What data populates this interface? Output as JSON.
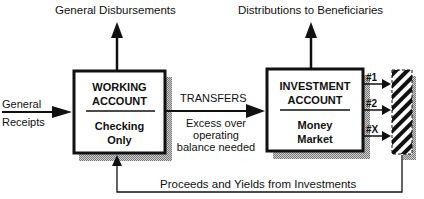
{
  "diagram": {
    "top_labels": {
      "general_disbursements": "General Disbursements",
      "distributions": "Distributions to Beneficiaries"
    },
    "input_label": {
      "line1": "General",
      "line2": "Receipts"
    },
    "working_account": {
      "title1": "WORKING",
      "title2": "ACCOUNT",
      "sub1": "Checking",
      "sub2": "Only"
    },
    "transfers": {
      "title": "TRANSFERS",
      "line1": "Excess over",
      "line2": "operating",
      "line3": "balance needed"
    },
    "investment_account": {
      "title1": "INVESTMENT",
      "title2": "ACCOUNT",
      "sub1": "Money",
      "sub2": "Market"
    },
    "investment_outputs": [
      "#1",
      "#2",
      "#X"
    ],
    "feedback_label": "Proceeds and Yields from Investments",
    "colors": {
      "line": "#111111",
      "shadow": "#9a9a9a",
      "background": "#ffffff"
    }
  }
}
